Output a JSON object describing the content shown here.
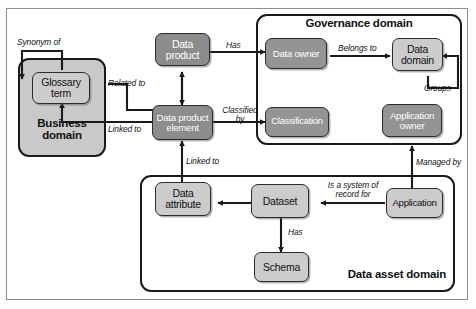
{
  "diagram": {
    "colors": {
      "node_dark": "#8c8c8c",
      "node_mid": "#949494",
      "node_light": "#cccccc",
      "domain_shaded": "#c9c9c9",
      "line": "#1a1a1a",
      "frame": "#8e8e8e"
    },
    "domains": [
      {
        "id": "business",
        "label": "Business\ndomain"
      },
      {
        "id": "governance",
        "label": "Governance domain"
      },
      {
        "id": "dataasset",
        "label": "Data asset domain"
      }
    ],
    "nodes": [
      {
        "id": "glossary-term",
        "label": "Glossary\nterm"
      },
      {
        "id": "data-product",
        "label": "Data\nproduct"
      },
      {
        "id": "data-product-element",
        "label": "Data product\nelement"
      },
      {
        "id": "data-owner",
        "label": "Data owner"
      },
      {
        "id": "data-domain",
        "label": "Data\ndomain"
      },
      {
        "id": "classification",
        "label": "Classification"
      },
      {
        "id": "application-owner",
        "label": "Application\nowner"
      },
      {
        "id": "data-attribute",
        "label": "Data\nattribute"
      },
      {
        "id": "dataset",
        "label": "Dataset"
      },
      {
        "id": "schema",
        "label": "Schema"
      },
      {
        "id": "application",
        "label": "Application"
      }
    ],
    "edges": [
      {
        "id": "synonym-of",
        "label": "Synonym of",
        "from": "glossary-term",
        "to": "glossary-term"
      },
      {
        "id": "related-to",
        "label": "Related to",
        "from": "data-product-element",
        "to": "glossary-term"
      },
      {
        "id": "linked-to-glossary",
        "label": "Linked to",
        "from": "data-product-element",
        "to": "glossary-term"
      },
      {
        "id": "has-owner",
        "label": "Has",
        "from": "data-product",
        "to": "data-owner"
      },
      {
        "id": "belongs-to",
        "label": "Belongs to",
        "from": "data-owner",
        "to": "data-domain"
      },
      {
        "id": "groups",
        "label": "Groups",
        "from": "data-domain",
        "to": "data-domain"
      },
      {
        "id": "classified-by",
        "label": "Classified\nby",
        "from": "data-product-element",
        "to": "classification"
      },
      {
        "id": "linked-to-attr",
        "label": "Linked to",
        "from": "data-attribute",
        "to": "data-product-element"
      },
      {
        "id": "has-schema",
        "label": "Has",
        "from": "dataset",
        "to": "schema"
      },
      {
        "id": "is-system-of-record",
        "label": "Is a system of\nrecord for",
        "from": "application",
        "to": "dataset"
      },
      {
        "id": "dataset-attribute",
        "label": "",
        "from": "dataset",
        "to": "data-attribute"
      },
      {
        "id": "managed-by",
        "label": "Managed by",
        "from": "application",
        "to": "application-owner"
      }
    ]
  }
}
